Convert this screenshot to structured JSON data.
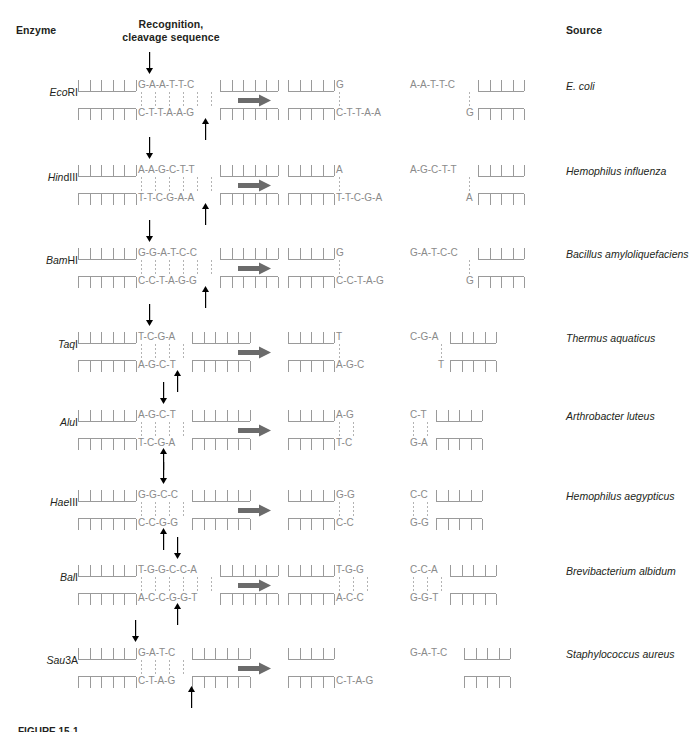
{
  "headers": {
    "enzyme": "Enzyme",
    "recognition_line1": "Recognition,",
    "recognition_line2": "cleavage sequence",
    "source": "Source"
  },
  "caption": "FIGURE 15-1",
  "colors": {
    "text": "#231f20",
    "base": "#8a8a8a",
    "backbone": "#9a9a9a",
    "hbond": "#b3b3b3",
    "reaction_arrow": "#6b6b6b",
    "cleavage_arrow": "#000000"
  },
  "rows": [
    {
      "enzyme_italic": "Eco",
      "enzyme_roman": "RI",
      "source": "E. coli",
      "substrate": {
        "top": "G-A-A-T-T-C",
        "bottom": "C-T-T-A-A-G"
      },
      "cut_top_after": 1,
      "cut_bottom_after": 5,
      "products": [
        {
          "top": "G",
          "bottom": "C-T-T-A-A"
        },
        {
          "top": "A-A-T-T-C",
          "bottom": "G"
        }
      ]
    },
    {
      "enzyme_italic": "Hin",
      "enzyme_roman": "dIII",
      "source": "Hemophilus influenza",
      "substrate": {
        "top": "A-A-G-C-T-T",
        "bottom": "T-T-C-G-A-A"
      },
      "cut_top_after": 1,
      "cut_bottom_after": 5,
      "products": [
        {
          "top": "A",
          "bottom": "T-T-C-G-A"
        },
        {
          "top": "A-G-C-T-T",
          "bottom": "A"
        }
      ]
    },
    {
      "enzyme_italic": "Bam",
      "enzyme_roman": "HI",
      "source": "Bacillus amyloliquefaciens",
      "substrate": {
        "top": "G-G-A-T-C-C",
        "bottom": "C-C-T-A-G-G"
      },
      "cut_top_after": 1,
      "cut_bottom_after": 5,
      "products": [
        {
          "top": "G",
          "bottom": "C-C-T-A-G"
        },
        {
          "top": "G-A-T-C-C",
          "bottom": "G"
        }
      ]
    },
    {
      "enzyme_italic": "Taq",
      "enzyme_roman": "I",
      "source": "Thermus aquaticus",
      "substrate": {
        "top": "T-C-G-A",
        "bottom": "A-G-C-T"
      },
      "cut_top_after": 1,
      "cut_bottom_after": 3,
      "products": [
        {
          "top": "T",
          "bottom": "A-G-C"
        },
        {
          "top": "C-G-A",
          "bottom": "T"
        }
      ]
    },
    {
      "enzyme_italic": "Alu",
      "enzyme_roman": "I",
      "source": "Arthrobacter luteus",
      "substrate": {
        "top": "A-G-C-T",
        "bottom": "T-C-G-A"
      },
      "cut_top_after": 2,
      "cut_bottom_after": 2,
      "products": [
        {
          "top": "A-G",
          "bottom": "T-C"
        },
        {
          "top": "C-T",
          "bottom": "G-A"
        }
      ]
    },
    {
      "enzyme_italic": "Hae",
      "enzyme_roman": "III",
      "source": "Hemophilus aegypticus",
      "substrate": {
        "top": "G-G-C-C",
        "bottom": "C-C-G-G"
      },
      "cut_top_after": 2,
      "cut_bottom_after": 2,
      "products": [
        {
          "top": "G-G",
          "bottom": "C-C"
        },
        {
          "top": "C-C",
          "bottom": "G-G"
        }
      ]
    },
    {
      "enzyme_italic": "Bal",
      "enzyme_roman": "I",
      "source": "Brevibacterium albidum",
      "substrate": {
        "top": "T-G-G-C-C-A",
        "bottom": "A-C-C-G-G-T"
      },
      "cut_top_after": 3,
      "cut_bottom_after": 3,
      "products": [
        {
          "top": "T-G-G",
          "bottom": "A-C-C"
        },
        {
          "top": "C-C-A",
          "bottom": "G-G-T"
        }
      ]
    },
    {
      "enzyme_italic": "Sau",
      "enzyme_roman": "3A",
      "source": "Staphylococcus aureus",
      "substrate": {
        "top": "G-A-T-C",
        "bottom": "C-T-A-G"
      },
      "cut_top_after": 0,
      "cut_bottom_after": 4,
      "products": [
        {
          "top": "",
          "bottom": "C-T-A-G"
        },
        {
          "top": "G-A-T-C",
          "bottom": ""
        }
      ]
    }
  ]
}
